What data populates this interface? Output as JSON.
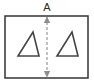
{
  "diagram": {
    "type": "dimension-diagram",
    "title_label": "A",
    "frame": {
      "name": "outer-rectangle",
      "x": 5,
      "y": 16,
      "width": 83,
      "height": 62,
      "stroke_color": "#333333",
      "stroke_width": 1.5,
      "fill_color": "#ffffff"
    },
    "dimension": {
      "label": "A",
      "orientation": "vertical",
      "style": "dashed double-headed arrow",
      "x": 47,
      "y_start": 17,
      "y_end": 77,
      "line_color": "#a8a8a8",
      "arrow_color": "#8c8c8c",
      "dash_pattern": "3 2"
    },
    "shapes": [
      {
        "name": "triangle-left",
        "label": "",
        "points": "18,56 39,56 33,32",
        "stroke_color": "#444444",
        "stroke_width": 1.6,
        "fill_color": "none"
      },
      {
        "name": "triangle-right",
        "label": "",
        "points": "57,56 78,56 72,32",
        "stroke_color": "#444444",
        "stroke_width": 1.6,
        "fill_color": "none"
      }
    ],
    "colors": {
      "background": "#ffffff",
      "frame_stroke": "#333333",
      "shape_stroke": "#444444",
      "dimension_line": "#a8a8a8",
      "label_text": "#2b2b2b"
    }
  }
}
